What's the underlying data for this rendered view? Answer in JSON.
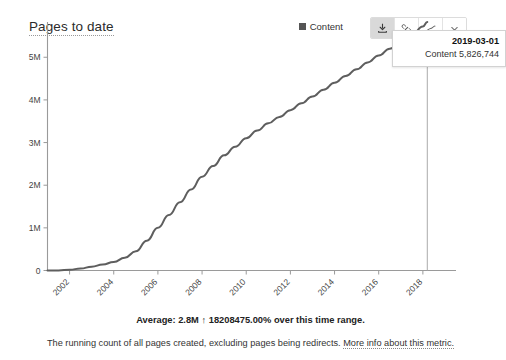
{
  "header": {
    "title": "Pages to date"
  },
  "legend": {
    "items": [
      {
        "label": "Content",
        "color": "#555555",
        "marker": "square-marker"
      }
    ]
  },
  "toolbar": {
    "buttons": [
      {
        "name": "download-button",
        "icon": "download-icon",
        "active": true
      },
      {
        "name": "permalink-button",
        "icon": "link-icon",
        "active": false
      },
      {
        "name": "chart-type-button",
        "icon": "line-chart-icon",
        "active": false
      },
      {
        "name": "chart-options-button",
        "icon": "chevron-down-icon",
        "active": false
      }
    ]
  },
  "tooltip": {
    "date": "2019-03-01",
    "series_label": "Content",
    "value": "5,826,744"
  },
  "summary": {
    "prefix": "Average: 2.8M",
    "arrow": "↑",
    "change": "18208475.00%",
    "suffix": "over this time range."
  },
  "description": {
    "text": "The running count of all pages created, excluding pages being redirects.",
    "link_text": "More info about this metric."
  },
  "chart_data": {
    "type": "line",
    "title": "Pages to date",
    "xlabel": "",
    "ylabel": "",
    "grid": false,
    "legend_position": "top-right",
    "xtick_labels": [
      "2002",
      "2004",
      "2006",
      "2008",
      "2010",
      "2012",
      "2014",
      "2016",
      "2018"
    ],
    "xtick_values": [
      2002,
      2004,
      2006,
      2008,
      2010,
      2012,
      2014,
      2016,
      2018
    ],
    "ytick_labels": [
      "0",
      "1M",
      "2M",
      "3M",
      "4M",
      "5M"
    ],
    "ytick_values": [
      0,
      1000000,
      2000000,
      3000000,
      4000000,
      5000000
    ],
    "xlim": [
      2001.0,
      2019.5
    ],
    "ylim": [
      0,
      5826744
    ],
    "series": [
      {
        "name": "Content",
        "color": "#5e5e5e",
        "x": [
          2001.0,
          2001.5,
          2002.0,
          2002.5,
          2003.0,
          2003.5,
          2004.0,
          2004.5,
          2005.0,
          2005.5,
          2006.0,
          2006.5,
          2007.0,
          2007.5,
          2008.0,
          2008.5,
          2009.0,
          2009.5,
          2010.0,
          2010.5,
          2011.0,
          2011.5,
          2012.0,
          2012.5,
          2013.0,
          2013.5,
          2014.0,
          2014.5,
          2015.0,
          2015.5,
          2016.0,
          2016.5,
          2017.0,
          2017.5,
          2018.0,
          2018.2
        ],
        "values": [
          32,
          1500,
          19000,
          45000,
          90000,
          140000,
          200000,
          300000,
          450000,
          700000,
          1000000,
          1300000,
          1600000,
          1900000,
          2200000,
          2450000,
          2700000,
          2900000,
          3100000,
          3280000,
          3450000,
          3600000,
          3760000,
          3920000,
          4080000,
          4240000,
          4400000,
          4560000,
          4720000,
          4880000,
          5040000,
          5200000,
          5360000,
          5520000,
          5720000,
          5826744
        ]
      }
    ],
    "annotations": [
      {
        "type": "crosshair",
        "x": 2018.2,
        "label": "2019-03-01",
        "value": 5826744
      }
    ]
  }
}
